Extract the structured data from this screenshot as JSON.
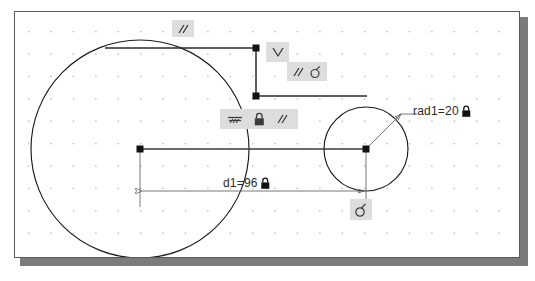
{
  "app": {
    "name": "sketch-constraint-canvas",
    "background_color": "#ffffff",
    "canvas_background": "#ffffff",
    "canvas_border_color": "#5a5a5a",
    "canvas_shadow_color": "#7b7b7b",
    "grid_dot_color": "#b9b9b9",
    "geometry_color": "#1a1a1a",
    "dimension_color": "#6a6a6a",
    "badge_background": "#dddddd",
    "badge_glyph_color": "#3a3a3a"
  },
  "dimensions": [
    {
      "name": "radius-dimension",
      "text": "rad1=20",
      "value": 20,
      "parameter": "rad1",
      "locked": true,
      "lock_icon": "lock-icon",
      "x": 412,
      "y": 99
    },
    {
      "name": "distance-dimension",
      "text": "d1=96",
      "value": 96,
      "parameter": "d1",
      "locked": true,
      "lock_icon": "lock-icon",
      "x": 222,
      "y": 172
    }
  ],
  "constraint_badges": [
    {
      "name": "parallel-badge-top",
      "glyphs": [
        "parallel-icon"
      ],
      "label": "//",
      "x": 171,
      "y": 19,
      "width": 22,
      "height": 17
    },
    {
      "name": "perpendicular-badge",
      "glyphs": [
        "perpendicular-icon"
      ],
      "label": "∨",
      "x": 265,
      "y": 41,
      "width": 22,
      "height": 19
    },
    {
      "name": "parallel-tangent-badge",
      "glyphs": [
        "parallel-icon",
        "tangent-icon"
      ],
      "label": "// ∂",
      "x": 286,
      "y": 61,
      "width": 40,
      "height": 19
    },
    {
      "name": "ground-lock-parallel-badge",
      "glyphs": [
        "ground-icon",
        "lock-icon",
        "parallel-icon"
      ],
      "label": "ground lock //",
      "x": 219,
      "y": 108,
      "width": 78,
      "height": 20
    },
    {
      "name": "tangent-badge-bottom",
      "glyphs": [
        "tangent-icon"
      ],
      "label": "∂",
      "x": 349,
      "y": 198,
      "width": 22,
      "height": 21
    }
  ],
  "geometry": {
    "circles": [
      {
        "name": "large-circle",
        "cx": 139,
        "cy": 148,
        "r": 109,
        "radius_label": null
      },
      {
        "name": "small-circle",
        "cx": 365,
        "cy": 148,
        "r": 42,
        "radius_label": "rad1=20"
      }
    ],
    "lines": [
      {
        "name": "top-horizontal-line",
        "x1": 104,
        "y1": 47,
        "x2": 255,
        "y2": 47
      },
      {
        "name": "connector-vertical-line",
        "x1": 255,
        "y1": 47,
        "x2": 255,
        "y2": 95
      },
      {
        "name": "second-horizontal-line",
        "x1": 255,
        "y1": 95,
        "x2": 365,
        "y2": 95
      },
      {
        "name": "center-to-center-line",
        "x1": 139,
        "y1": 148,
        "x2": 365,
        "y2": 148
      },
      {
        "name": "left-extension-line",
        "x1": 139,
        "y1": 148,
        "x2": 139,
        "y2": 205
      },
      {
        "name": "right-extension-line",
        "x1": 365,
        "y1": 148,
        "x2": 365,
        "y2": 205
      }
    ],
    "dimension_lines": [
      {
        "name": "d1-dimension-line",
        "x1": 140,
        "y1": 190,
        "x2": 365,
        "y2": 190,
        "arrows": "both"
      },
      {
        "name": "rad1-leader-line",
        "x1": 365,
        "y1": 148,
        "x2": 400,
        "y2": 113,
        "arrows": "end"
      }
    ],
    "handles": [
      {
        "name": "point-handle",
        "x": 255,
        "y": 47
      },
      {
        "name": "point-handle",
        "x": 255,
        "y": 95
      },
      {
        "name": "point-handle",
        "x": 139,
        "y": 148
      },
      {
        "name": "point-handle",
        "x": 365,
        "y": 148
      }
    ]
  },
  "grid": {
    "name": "dot-grid",
    "spacing_x": 22.4,
    "spacing_y": 22.4,
    "origin_x": 27,
    "origin_y": 30,
    "dot_color": "#b9b9b9"
  }
}
